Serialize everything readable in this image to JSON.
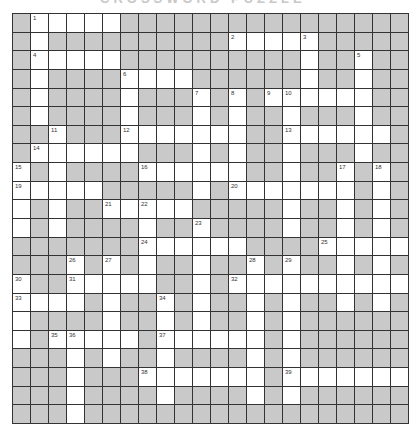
{
  "header": {
    "title_fragment": "CROSSWORD PUZZLE"
  },
  "puzzle": {
    "rows": 22,
    "cols": 22,
    "colors": {
      "block": "#c9c9c9",
      "open": "#ffffff",
      "line": "#333333"
    },
    "grid": [
      ".#####................",
      ".#..........#####.....",
      ".#####..........#..#..",
      ".#....####......#..#..",
      ".#....#...#.#.######..",
      ".#....#...#.#..#...#..",
      "..#...#######..######.",
      ".######...#.#..#...#..",
      "#.#....######..#..#.#.",
      "#####.....#.#######.#.",
      "#.#..#####.....#..#.#.",
      "#.#....#..#....#..#.#.",
      ".......######....#####",
      "...#.#.#..#..#.#..#.#.",
      "#..#####..#.##########",
      "####.#..#.#..#.#..#.#.",
      "#....#..#.#..#.#......",
      "#.#####.######.#......",
      "...#.#..#....#.#......",
      "...#...#######.#######",
      "...#....#....#.#......",
      "...#.................."
    ],
    "numbers": [
      {
        "r": 0,
        "c": 1,
        "n": "1"
      },
      {
        "r": 1,
        "c": 12,
        "n": "2"
      },
      {
        "r": 1,
        "c": 16,
        "n": "3"
      },
      {
        "r": 2,
        "c": 1,
        "n": "4"
      },
      {
        "r": 2,
        "c": 19,
        "n": "5"
      },
      {
        "r": 3,
        "c": 6,
        "n": "6"
      },
      {
        "r": 4,
        "c": 10,
        "n": "7"
      },
      {
        "r": 4,
        "c": 12,
        "n": "8"
      },
      {
        "r": 4,
        "c": 14,
        "n": "9"
      },
      {
        "r": 4,
        "c": 15,
        "n": "10"
      },
      {
        "r": 6,
        "c": 2,
        "n": "11"
      },
      {
        "r": 6,
        "c": 6,
        "n": "12"
      },
      {
        "r": 6,
        "c": 15,
        "n": "13"
      },
      {
        "r": 7,
        "c": 1,
        "n": "14"
      },
      {
        "r": 8,
        "c": 0,
        "n": "15"
      },
      {
        "r": 8,
        "c": 7,
        "n": "16"
      },
      {
        "r": 8,
        "c": 18,
        "n": "17"
      },
      {
        "r": 8,
        "c": 20,
        "n": "18"
      },
      {
        "r": 9,
        "c": 0,
        "n": "19"
      },
      {
        "r": 9,
        "c": 12,
        "n": "20"
      },
      {
        "r": 10,
        "c": 5,
        "n": "21"
      },
      {
        "r": 10,
        "c": 7,
        "n": "22"
      },
      {
        "r": 11,
        "c": 10,
        "n": "23"
      },
      {
        "r": 12,
        "c": 7,
        "n": "24"
      },
      {
        "r": 12,
        "c": 17,
        "n": "25"
      },
      {
        "r": 13,
        "c": 3,
        "n": "26"
      },
      {
        "r": 13,
        "c": 5,
        "n": "27"
      },
      {
        "r": 13,
        "c": 13,
        "n": "28"
      },
      {
        "r": 13,
        "c": 15,
        "n": "29"
      },
      {
        "r": 14,
        "c": 0,
        "n": "30"
      },
      {
        "r": 14,
        "c": 3,
        "n": "31"
      },
      {
        "r": 14,
        "c": 12,
        "n": "32"
      },
      {
        "r": 15,
        "c": 0,
        "n": "33"
      },
      {
        "r": 15,
        "c": 8,
        "n": "34"
      },
      {
        "r": 17,
        "c": 2,
        "n": "35"
      },
      {
        "r": 17,
        "c": 3,
        "n": "36"
      },
      {
        "r": 17,
        "c": 8,
        "n": "37"
      },
      {
        "r": 19,
        "c": 7,
        "n": "38"
      },
      {
        "r": 19,
        "c": 15,
        "n": "39"
      }
    ]
  }
}
